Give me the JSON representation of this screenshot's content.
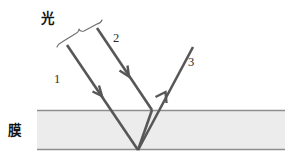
{
  "figure": {
    "canvas": {
      "width": 285,
      "height": 165,
      "background": "#ffffff"
    },
    "colors": {
      "ray": "#575757",
      "film_fill": "#ececec",
      "film_edge": "#8e8e8e",
      "brace": "#6d6d6d",
      "text": "#2b2b2b",
      "cjk_text": "#151515"
    },
    "labels": {
      "light_source": "光",
      "film": "膜",
      "ray_one": "1",
      "ray_two": "2",
      "ray_three": "3"
    },
    "film_layer": {
      "label": "膜",
      "left": 37,
      "right": 285,
      "top_y": 110,
      "bottom_y": 150,
      "thickness": 40
    },
    "rays": [
      {
        "id": "1",
        "label": "1",
        "role": "incident-ray-refracted",
        "direction": "down-right",
        "points": "67,45 138,150",
        "arrow_at": {
          "x": 101,
          "y": 95
        },
        "label_pos": {
          "x": 57,
          "y": 83
        }
      },
      {
        "id": "2",
        "label": "2",
        "role": "incident-ray-reflected",
        "direction": "down-right",
        "points": "97,28 152,110",
        "arrow_at": {
          "x": 128,
          "y": 74
        },
        "label_pos": {
          "x": 116,
          "y": 42
        }
      },
      {
        "id": "3",
        "label": "3",
        "role": "outgoing-ray",
        "direction": "up-right",
        "points": "138,150 193,47",
        "arrow_at": {
          "x": 166,
          "y": 95
        },
        "label_pos": {
          "x": 189,
          "y": 64
        }
      }
    ],
    "internal_segment": {
      "points": "152,110 138,150"
    },
    "brace": {
      "label": "光",
      "label_pos": {
        "x": 47,
        "y": 23
      },
      "spans": "ray 1 and ray 2 incoming beams",
      "path": "M 57,47 Q 58,44 62,42 L 75,34 Q 79,32 79,29 Q 80,32 84,31 L 97,24 Q 101,23 102,20"
    }
  }
}
